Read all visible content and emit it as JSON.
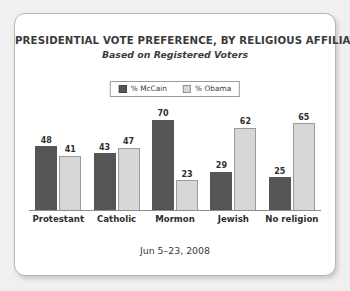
{
  "chart_data": {
    "type": "bar",
    "title": "PRESIDENTIAL VOTE PREFERENCE, BY RELIGIOUS AFFILIATION",
    "subtitle": "Based on Registered Voters",
    "footer": "Jun 5–23, 2008",
    "categories": [
      "Protestant",
      "Catholic",
      "Mormon",
      "Jewish",
      "No religion"
    ],
    "series": [
      {
        "name": "% McCain",
        "color": "#555555",
        "values": [
          48,
          43,
          70,
          29,
          25
        ]
      },
      {
        "name": "% Obama",
        "color": "#d7d7d7",
        "values": [
          41,
          47,
          23,
          62,
          65
        ]
      }
    ],
    "xlabel": "",
    "ylabel": "",
    "ylim": [
      0,
      75
    ],
    "grid": false,
    "legend_position": "top-center",
    "axis_visible": true,
    "value_labels": true
  },
  "legend": {
    "items": [
      {
        "label": "% McCain",
        "swatch": "dark-swatch-icon"
      },
      {
        "label": "% Obama",
        "swatch": "light-swatch-icon"
      }
    ]
  },
  "groups": [
    {
      "category": "Protestant",
      "mccain": 48,
      "obama": 41
    },
    {
      "category": "Catholic",
      "mccain": 43,
      "obama": 47
    },
    {
      "category": "Mormon",
      "mccain": 70,
      "obama": 23
    },
    {
      "category": "Jewish",
      "mccain": 29,
      "obama": 62
    },
    {
      "category": "No religion",
      "mccain": 25,
      "obama": 65
    }
  ],
  "colors": {
    "mccain": "#555555",
    "obama": "#d7d7d7",
    "axis": "#8d8d8d",
    "text": "#3a3a3a",
    "card_border": "#b6b6b6",
    "background": "#f0f0f0"
  }
}
